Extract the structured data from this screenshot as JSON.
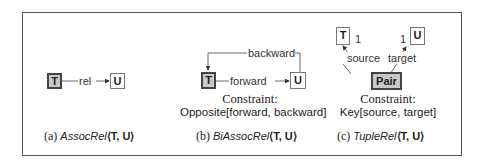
{
  "panels": [
    {
      "id": "a",
      "nodes": {
        "source": "T",
        "target": "U"
      },
      "edge_label": "rel",
      "caption": {
        "prefix": "(a)",
        "name": "AssocRel",
        "args": "⟨T, U⟩"
      }
    },
    {
      "id": "b",
      "nodes": {
        "source": "T",
        "target": "U"
      },
      "edges": {
        "top": "backward",
        "middle": "forward"
      },
      "constraint": {
        "title": "Constraint:",
        "body": "Opposite[forward, backward]"
      },
      "caption": {
        "prefix": "(b)",
        "name": "BiAssocRel",
        "args": "⟨T, U⟩"
      }
    },
    {
      "id": "c",
      "nodes": {
        "left": "T",
        "right": "U",
        "center": "Pair"
      },
      "multiplicity": {
        "left": "1",
        "right": "1"
      },
      "edges": {
        "left": "source",
        "right": "target"
      },
      "constraint": {
        "title": "Constraint:",
        "body": "Key[source, target]"
      },
      "caption": {
        "prefix": "(c)",
        "name": "TupleRel",
        "args": "⟨T, U⟩"
      }
    }
  ]
}
